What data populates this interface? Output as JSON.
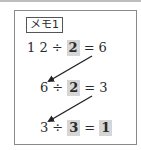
{
  "memo": {
    "label": "メモ1",
    "highlight_color": "#d6d6d6",
    "equations": [
      {
        "dividend": "1 2",
        "op": "÷",
        "divisor": "2",
        "eq": "=",
        "result": "6",
        "result_highlighted": false
      },
      {
        "dividend": "6",
        "op": "÷",
        "divisor": "2",
        "eq": "=",
        "result": "3",
        "result_highlighted": false
      },
      {
        "dividend": "3",
        "op": "÷",
        "divisor": "3",
        "eq": "=",
        "result": "1",
        "result_highlighted": true
      }
    ],
    "arrows": [
      {
        "from": "6",
        "to": "6"
      },
      {
        "from": "3",
        "to": "3"
      }
    ]
  }
}
